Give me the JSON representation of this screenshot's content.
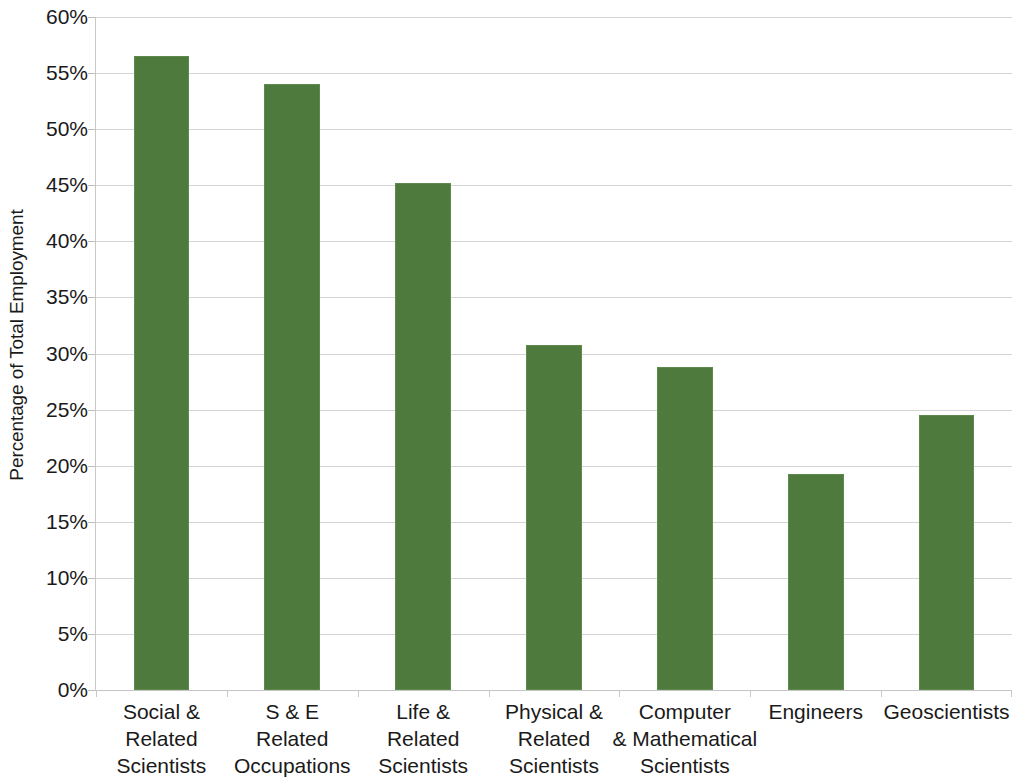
{
  "chart_data": {
    "type": "bar",
    "title": "",
    "subtitle": "",
    "xlabel": "",
    "ylabel": "Percentage of Total Employment",
    "ylim": [
      0,
      60
    ],
    "y_tick_labels": [
      "60%",
      "55%",
      "50%",
      "45%",
      "40%",
      "35%",
      "30%",
      "25%",
      "20%",
      "15%",
      "10%",
      "5%",
      "0%"
    ],
    "y_ticks": [
      60,
      55,
      50,
      45,
      40,
      35,
      30,
      25,
      20,
      15,
      10,
      5,
      0
    ],
    "grid": true,
    "legend": "none",
    "bar_color": "#4F7A3E",
    "categories": [
      "Social & Related Scientists",
      "S & E Related Occupations",
      "Life & Related Scientists",
      "Physical & Related Scientists",
      "Computer & Mathematical Scientists",
      "Engineers",
      "Geoscientists"
    ],
    "category_lines": [
      [
        "Social &",
        "Related",
        "Scientists"
      ],
      [
        "S & E",
        "Related",
        "Occupations"
      ],
      [
        "Life &",
        "Related",
        "Scientists"
      ],
      [
        "Physical &",
        "Related",
        "Scientists"
      ],
      [
        "Computer",
        "& Mathematical",
        "Scientists"
      ],
      [
        "Engineers"
      ],
      [
        "Geoscientists"
      ]
    ],
    "values": [
      56.5,
      54.0,
      45.2,
      30.8,
      28.8,
      19.3,
      24.5
    ],
    "value_labels": [
      "56.5%",
      "54.0%",
      "45.2%",
      "30.8%",
      "28.8%",
      "19.3%",
      "24.5%"
    ]
  }
}
